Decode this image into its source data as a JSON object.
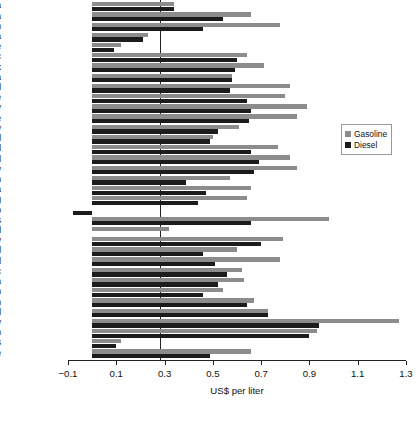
{
  "chart_data": {
    "type": "bar",
    "orientation": "horizontal",
    "title": "",
    "xlabel": "US$ per liter",
    "ylabel": "",
    "xlim": [
      -0.1,
      1.3
    ],
    "xticks": [
      -0.1,
      0.1,
      0.3,
      0.5,
      0.7,
      0.9,
      1.1,
      1.3
    ],
    "xtick_labels": [
      "−0.1",
      "0.1",
      "0.3",
      "0.5",
      "0.7",
      "0.9",
      "1.1",
      "1.3"
    ],
    "grid": false,
    "legend_position": "right",
    "categories": [
      "Australia",
      "Austria",
      "Belgium",
      "Canada",
      "Chile",
      "Czech Republic",
      "Denmark",
      "Estonia",
      "Finland",
      "France",
      "Germany",
      "Greece",
      "Hungary",
      "Iceland",
      "Ireland",
      "Israel",
      "Italy",
      "Japan",
      "Korea",
      "Luxembourg",
      "Mexico",
      "Netherlands",
      "New Zealand",
      "Norway",
      "Poland",
      "Portugal",
      "Slovak Republic",
      "Slovenia",
      "Spain",
      "Sweden",
      "Switzerland",
      "Turkey",
      "United Kingdom",
      "United States",
      "Simple average"
    ],
    "series": [
      {
        "name": "Gasoline",
        "color": "#8c8c8c",
        "values": [
          0.34,
          0.66,
          0.78,
          0.23,
          0.12,
          0.64,
          0.71,
          0.58,
          0.82,
          0.8,
          0.89,
          0.85,
          0.61,
          0.5,
          0.77,
          0.82,
          0.85,
          0.57,
          0.66,
          0.64,
          0.0,
          0.98,
          0.32,
          0.79,
          0.6,
          0.78,
          0.62,
          0.63,
          0.54,
          0.67,
          0.73,
          1.27,
          0.93,
          0.12,
          0.66
        ]
      },
      {
        "name": "Diesel",
        "color": "#1c1c1c",
        "values": [
          0.34,
          0.54,
          0.46,
          0.21,
          0.09,
          0.6,
          0.59,
          0.58,
          0.57,
          0.64,
          0.66,
          0.65,
          0.52,
          0.49,
          0.66,
          0.69,
          0.67,
          0.39,
          0.47,
          0.44,
          -0.08,
          0.66,
          0.0,
          0.7,
          0.46,
          0.51,
          0.56,
          0.52,
          0.46,
          0.64,
          0.73,
          0.94,
          0.9,
          0.1,
          0.49
        ]
      }
    ]
  },
  "legend": {
    "entries": [
      {
        "label": "Gasoline",
        "swatch": "gasoline"
      },
      {
        "label": "Diesel",
        "swatch": "diesel"
      }
    ]
  }
}
